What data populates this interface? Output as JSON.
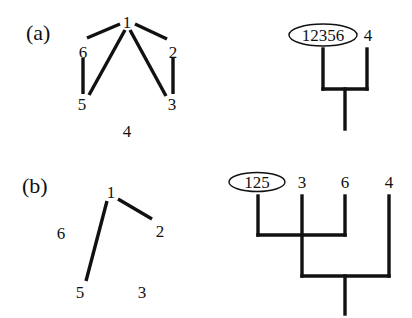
{
  "panels": [
    {
      "label": "(a)",
      "graph": {
        "nodes": [
          {
            "id": "1",
            "label": "1"
          },
          {
            "id": "2",
            "label": "2"
          },
          {
            "id": "3",
            "label": "3"
          },
          {
            "id": "4",
            "label": "4"
          },
          {
            "id": "5",
            "label": "5"
          },
          {
            "id": "6",
            "label": "6"
          }
        ],
        "edges": [
          [
            "1",
            "6"
          ],
          [
            "1",
            "2"
          ],
          [
            "6",
            "5"
          ],
          [
            "2",
            "3"
          ],
          [
            "1",
            "5"
          ],
          [
            "1",
            "3"
          ]
        ]
      },
      "dendrogram": {
        "leaves": [
          {
            "label": "12356",
            "circled": true
          },
          {
            "label": "4",
            "circled": false
          }
        ],
        "merges": [
          [
            "12356",
            "4"
          ]
        ]
      }
    },
    {
      "label": "(b)",
      "graph": {
        "nodes": [
          {
            "id": "1",
            "label": "1"
          },
          {
            "id": "2",
            "label": "2"
          },
          {
            "id": "3",
            "label": "3"
          },
          {
            "id": "5",
            "label": "5"
          },
          {
            "id": "6",
            "label": "6"
          }
        ],
        "edges": [
          [
            "1",
            "5"
          ],
          [
            "1",
            "2"
          ]
        ]
      },
      "dendrogram": {
        "leaves": [
          {
            "label": "125",
            "circled": true
          },
          {
            "label": "3",
            "circled": false
          },
          {
            "label": "6",
            "circled": false
          },
          {
            "label": "4",
            "circled": false
          }
        ],
        "merges": [
          [
            "125",
            "6"
          ],
          [
            "3",
            "4"
          ]
        ]
      }
    }
  ]
}
